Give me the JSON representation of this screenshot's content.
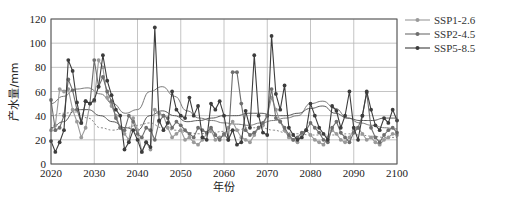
{
  "chart_data": {
    "type": "line",
    "title": "",
    "xlabel": "年份",
    "ylabel": "产水量/mm",
    "xlim": [
      2020,
      2100
    ],
    "ylim": [
      0,
      120
    ],
    "xticks": [
      2020,
      2030,
      2040,
      2050,
      2060,
      2070,
      2080,
      2090,
      2100
    ],
    "yticks": [
      0,
      20,
      40,
      60,
      80,
      100,
      120
    ],
    "grid": true,
    "legend_position": "right-top",
    "x": [
      2020,
      2021,
      2022,
      2023,
      2024,
      2025,
      2026,
      2027,
      2028,
      2029,
      2030,
      2031,
      2032,
      2033,
      2034,
      2035,
      2036,
      2037,
      2038,
      2039,
      2040,
      2041,
      2042,
      2043,
      2044,
      2045,
      2046,
      2047,
      2048,
      2049,
      2050,
      2051,
      2052,
      2053,
      2054,
      2055,
      2056,
      2057,
      2058,
      2059,
      2060,
      2061,
      2062,
      2063,
      2064,
      2065,
      2066,
      2067,
      2068,
      2069,
      2070,
      2071,
      2072,
      2073,
      2074,
      2075,
      2076,
      2077,
      2078,
      2079,
      2080,
      2081,
      2082,
      2083,
      2084,
      2085,
      2086,
      2087,
      2088,
      2089,
      2090,
      2091,
      2092,
      2093,
      2094,
      2095,
      2096,
      2097,
      2098,
      2099,
      2100
    ],
    "series": [
      {
        "name": "SSP1-2.6",
        "color": "#9a9a9a",
        "values": [
          28,
          32,
          62,
          60,
          62,
          45,
          35,
          22,
          30,
          50,
          52,
          86,
          80,
          55,
          48,
          40,
          30,
          25,
          20,
          38,
          28,
          10,
          18,
          12,
          45,
          42,
          40,
          30,
          22,
          25,
          28,
          20,
          22,
          18,
          16,
          20,
          25,
          28,
          20,
          22,
          24,
          30,
          35,
          28,
          22,
          20,
          18,
          24,
          30,
          32,
          40,
          55,
          45,
          35,
          28,
          22,
          20,
          18,
          25,
          28,
          24,
          20,
          18,
          16,
          22,
          28,
          25,
          20,
          18,
          22,
          28,
          30,
          25,
          20,
          22,
          18,
          16,
          20,
          22,
          25,
          24
        ]
      },
      {
        "name": "SSP2-4.5",
        "color": "#6e6e6e",
        "values": [
          53,
          28,
          30,
          40,
          70,
          61,
          45,
          34,
          52,
          50,
          86,
          64,
          72,
          60,
          52,
          38,
          30,
          28,
          40,
          35,
          25,
          22,
          30,
          28,
          20,
          35,
          40,
          38,
          30,
          35,
          32,
          28,
          25,
          22,
          30,
          28,
          26,
          30,
          24,
          20,
          25,
          20,
          76,
          76,
          50,
          28,
          24,
          26,
          30,
          34,
          40,
          62,
          38,
          35,
          30,
          24,
          20,
          22,
          26,
          28,
          34,
          30,
          26,
          20,
          18,
          30,
          35,
          26,
          22,
          18,
          26,
          30,
          40,
          59,
          30,
          22,
          18,
          24,
          28,
          30,
          26
        ]
      },
      {
        "name": "SSP5-8.5",
        "color": "#3c3c3c",
        "values": [
          19,
          10,
          18,
          28,
          86,
          77,
          51,
          34,
          52,
          50,
          53,
          64,
          90,
          69,
          57,
          45,
          40,
          12,
          18,
          28,
          20,
          10,
          18,
          14,
          113,
          36,
          28,
          34,
          60,
          45,
          40,
          38,
          55,
          40,
          48,
          22,
          20,
          50,
          45,
          52,
          40,
          20,
          28,
          16,
          18,
          44,
          30,
          90,
          40,
          26,
          24,
          106,
          58,
          45,
          65,
          30,
          24,
          20,
          22,
          28,
          50,
          40,
          30,
          25,
          20,
          48,
          44,
          30,
          40,
          60,
          30,
          20,
          40,
          60,
          45,
          32,
          28,
          38,
          34,
          45,
          36
        ]
      }
    ],
    "trend_lines": [
      {
        "name": "SSP1-2.6 trend",
        "style": "dotted",
        "approx": [
          40,
          42,
          43,
          38,
          30,
          28,
          30,
          32,
          34,
          30,
          28,
          26,
          25,
          26,
          27,
          28,
          30,
          30,
          28,
          26,
          25,
          24,
          24,
          24,
          25,
          24,
          23,
          22,
          22
        ]
      },
      {
        "name": "SSP2-4.5 trend",
        "style": "solid-smooth",
        "approx": [
          50,
          56,
          62,
          63,
          58,
          50,
          42,
          45,
          60,
          64,
          56,
          44,
          38,
          36,
          34,
          33,
          32,
          34,
          36,
          38,
          40,
          50,
          52,
          46,
          38,
          34,
          32,
          30,
          29
        ]
      },
      {
        "name": "SSP5-8.5 trend",
        "style": "smooth",
        "approx": [
          30,
          35,
          45,
          45,
          40,
          35,
          30,
          28,
          40,
          44,
          40,
          35,
          36,
          38,
          40,
          40,
          42,
          42,
          40,
          40,
          42,
          46,
          48,
          42,
          38,
          36,
          36,
          38,
          38
        ]
      }
    ]
  },
  "legend": {
    "items": [
      {
        "label": "SSP1-2.6"
      },
      {
        "label": "SSP2-4.5"
      },
      {
        "label": "SSP5-8.5"
      }
    ]
  },
  "axes": {
    "xlabel": "年份",
    "ylabel": "产水量/mm"
  }
}
